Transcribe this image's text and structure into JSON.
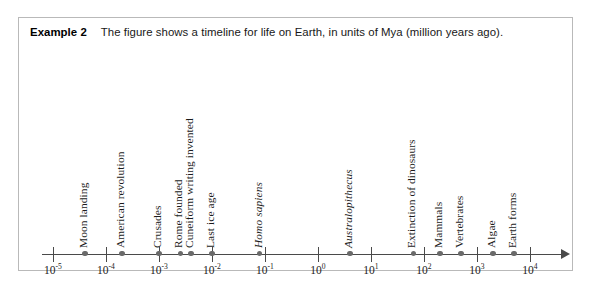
{
  "example": {
    "label": "Example 2",
    "text": "The figure shows a timeline for life on Earth, in units of Mya (million years ago)."
  },
  "chart_data": {
    "type": "scatter",
    "title": "",
    "xlabel": "",
    "ylabel": "",
    "scale": "log10",
    "units": "Mya (million years ago)",
    "grid": false,
    "legend": false,
    "xlim": [
      -5.4,
      4.3
    ],
    "axis_ticks": [
      {
        "exponent": "-5",
        "base": "10",
        "value": 1e-05
      },
      {
        "exponent": "-4",
        "base": "10",
        "value": 0.0001
      },
      {
        "exponent": "-3",
        "base": "10",
        "value": 0.001
      },
      {
        "exponent": "-2",
        "base": "10",
        "value": 0.01
      },
      {
        "exponent": "-1",
        "base": "10",
        "value": 0.1
      },
      {
        "exponent": "0",
        "base": "10",
        "value": 1
      },
      {
        "exponent": "1",
        "base": "10",
        "value": 10
      },
      {
        "exponent": "2",
        "base": "10",
        "value": 100
      },
      {
        "exponent": "3",
        "base": "10",
        "value": 1000
      },
      {
        "exponent": "4",
        "base": "10",
        "value": 10000
      }
    ],
    "events": [
      {
        "label": "Moon landing",
        "log_value": -4.4,
        "italic": false
      },
      {
        "label": "American revolution",
        "log_value": -3.7,
        "italic": false
      },
      {
        "label": "Crusades",
        "log_value": -3.0,
        "italic": false
      },
      {
        "label": "Rome founded",
        "log_value": -2.6,
        "italic": false
      },
      {
        "label": "Cuneiform writing invented",
        "log_value": -2.4,
        "italic": false
      },
      {
        "label": "Last ice age",
        "log_value": -2.0,
        "italic": false
      },
      {
        "label": "Homo sapiens",
        "log_value": -1.1,
        "italic": true
      },
      {
        "label": "Australopithecus",
        "log_value": 0.6,
        "italic": true
      },
      {
        "label": "Extinction of dinosaurs",
        "log_value": 1.8,
        "italic": false
      },
      {
        "label": "Mammals",
        "log_value": 2.3,
        "italic": false
      },
      {
        "label": "Vertebrates",
        "log_value": 2.7,
        "italic": false
      },
      {
        "label": "Algae",
        "log_value": 3.3,
        "italic": false
      },
      {
        "label": "Earth forms",
        "log_value": 3.7,
        "italic": false
      }
    ]
  }
}
